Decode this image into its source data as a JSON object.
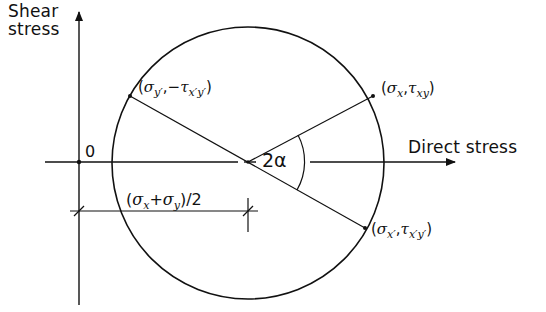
{
  "figure": {
    "axes": {
      "vertical_label_line1": "Shear",
      "vertical_label_line2": "stress",
      "horizontal_label": "Direct stress",
      "origin_label": "0"
    },
    "points": [
      {
        "id": "A",
        "label_parts": [
          "(",
          "σ",
          "x",
          ",",
          "τ",
          "xy",
          ")"
        ],
        "label_text": "(σx, τxy)"
      },
      {
        "id": "B",
        "label_parts": [
          "(",
          "σ",
          "y′",
          ",−",
          "τ",
          "x′y′",
          ")"
        ],
        "label_text": "(σy′, −τx′y′)"
      },
      {
        "id": "C",
        "label_parts": [
          "(",
          "σ",
          "x′",
          ",",
          "τ",
          "x′y′",
          ")"
        ],
        "label_text": "(σx′, τx′y′)"
      }
    ],
    "angle_label": "2α",
    "center_dimension": {
      "open": "(",
      "s1": "σ",
      "s1_sub": "x",
      "plus": "+",
      "s2": "σ",
      "s2_sub": "y",
      "close": ")/2",
      "text": "(σx + σy)/2"
    },
    "colors": {
      "ink": "#111111",
      "background": "#ffffff"
    }
  }
}
